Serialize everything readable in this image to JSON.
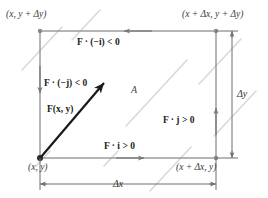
{
  "figure": {
    "colors": {
      "rectangle_edge": "#8e8e92",
      "background_streak": "#d9d9dd",
      "vector_arrow": "#1a1a1a",
      "dimension_line": "#6e6e72",
      "text": "#231f20",
      "corner_dot": "#77777b",
      "origin_dot": "#2a2a2a",
      "page_background": "#ffffff"
    },
    "corners": {
      "top_left": "(x, y + Δy)",
      "top_right": "(x + Δx, y + Δy)",
      "bottom_left": "(x, y)",
      "bottom_right": "(x + Δx, y)"
    },
    "flux_labels": {
      "top": "F · (−i) < 0",
      "left": "F · (−j) < 0",
      "right": "F · j > 0",
      "bottom": "F · i > 0"
    },
    "vector_field_label": "F(x, y)",
    "area_label": "A",
    "dimensions": {
      "width_label": "Δx",
      "height_label": "Δy"
    },
    "edge_arrow_directions": {
      "top": "left",
      "left": "down",
      "right": "up",
      "bottom": "right"
    }
  }
}
